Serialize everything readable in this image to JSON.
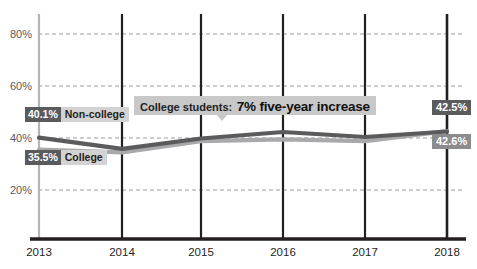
{
  "chart_data": {
    "type": "line",
    "title": "",
    "xlabel": "",
    "ylabel": "",
    "categories": [
      "2013",
      "2014",
      "2015",
      "2016",
      "2017",
      "2018"
    ],
    "x": [
      2013,
      2014,
      2015,
      2016,
      2017,
      2018
    ],
    "ylim": [
      10,
      90
    ],
    "yticks": [
      20,
      40,
      60,
      80
    ],
    "ytick_labels": [
      "20%",
      "40%",
      "60%",
      "80%"
    ],
    "grid": true,
    "legend": "inline-labels",
    "series": [
      {
        "name": "Non-college",
        "color": "#5b5b5d",
        "values": [
          40.1,
          35.8,
          39.8,
          42.3,
          40.4,
          42.5
        ],
        "start_label": "40.1%",
        "end_label": "42.5%"
      },
      {
        "name": "College",
        "color": "#a9a9ab",
        "values": [
          35.5,
          34.5,
          38.8,
          39.5,
          38.8,
          42.6
        ],
        "start_label": "35.5%",
        "end_label": "42.6%"
      }
    ],
    "annotations": [
      {
        "lead": "College students:",
        "strong": "7% five-year increase",
        "points_at_year": 2015
      }
    ]
  },
  "axis": {
    "ytick_labels": [
      "80%",
      "60%",
      "40%",
      "20%"
    ],
    "xtick_labels": [
      "2013",
      "2014",
      "2015",
      "2016",
      "2017",
      "2018"
    ]
  },
  "labels": {
    "noncollege_value": "40.1%",
    "noncollege_name": "Non-college",
    "college_value": "35.5%",
    "college_name": "College",
    "noncollege_end": "42.5%",
    "college_end": "42.6%"
  },
  "annotation": {
    "lead": "College students:",
    "strong": "7% five-year increase"
  },
  "colors": {
    "noncollege_line": "#5b5b5d",
    "college_line": "#a9a9ab",
    "grid": "#9a9a9a",
    "axis": "#231f20",
    "annotation_bg": "#c8c8c8",
    "tag_dark": "#5b5b5d",
    "tag_light": "#d3d3d3"
  }
}
